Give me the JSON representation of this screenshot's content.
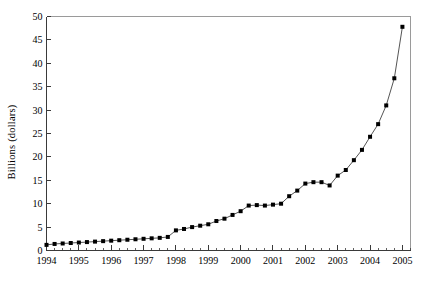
{
  "chart_data": {
    "type": "line",
    "title": "",
    "subtitle": "",
    "xlabel": "",
    "ylabel": "Billions (dollars)",
    "xlim": [
      1994,
      2005.25
    ],
    "ylim": [
      0,
      50
    ],
    "ytick_step": 5,
    "grid": false,
    "legend": false,
    "marker": "square",
    "marker_color": "#000000",
    "line_color": "#555555",
    "x_tick_labels": [
      "1994",
      "1995",
      "1996",
      "1997",
      "1998",
      "1999",
      "2000",
      "2001",
      "2002",
      "2003",
      "2004",
      "2005"
    ],
    "y_tick_labels": [
      "0",
      "5",
      "10",
      "15",
      "20",
      "25",
      "30",
      "35",
      "40",
      "45",
      "50"
    ],
    "x_minor_ticks_per_year": 4,
    "series": [
      {
        "name": "value",
        "x": [
          1994.0,
          1994.25,
          1994.5,
          1994.75,
          1995.0,
          1995.25,
          1995.5,
          1995.75,
          1996.0,
          1996.25,
          1996.5,
          1996.75,
          1997.0,
          1997.25,
          1997.5,
          1997.75,
          1998.0,
          1998.25,
          1998.5,
          1998.75,
          1999.0,
          1999.25,
          1999.5,
          1999.75,
          2000.0,
          2000.25,
          2000.5,
          2000.75,
          2001.0,
          2001.25,
          2001.5,
          2001.75,
          2002.0,
          2002.25,
          2002.5,
          2002.75,
          2003.0,
          2003.25,
          2003.5,
          2003.75,
          2004.0,
          2004.25,
          2004.5,
          2004.75,
          2005.0
        ],
        "values": [
          1.2,
          1.4,
          1.5,
          1.6,
          1.7,
          1.8,
          1.9,
          2.0,
          2.1,
          2.2,
          2.3,
          2.4,
          2.5,
          2.6,
          2.7,
          2.9,
          4.3,
          4.6,
          5.0,
          5.3,
          5.6,
          6.3,
          6.8,
          7.6,
          8.4,
          9.6,
          9.7,
          9.6,
          9.8,
          10.0,
          11.6,
          12.8,
          14.3,
          14.6,
          14.6,
          13.9,
          16.0,
          17.2,
          19.3,
          21.5,
          24.3,
          27.0,
          31.0,
          36.8,
          47.8
        ]
      }
    ]
  }
}
